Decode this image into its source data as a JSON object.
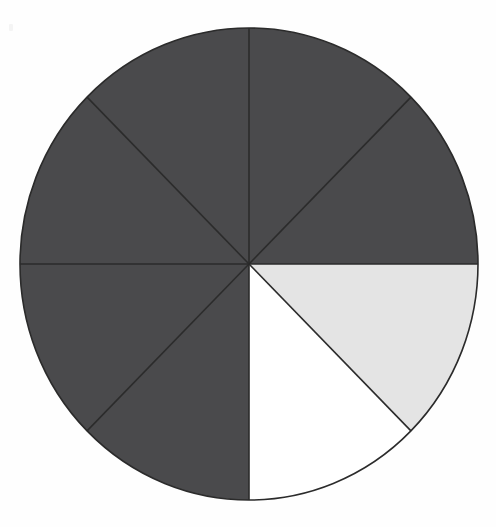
{
  "figure": {
    "title": "Fraction circle divided into eighths",
    "background_color": "#fefefe",
    "stroke_color": "#2b2b2b",
    "stroke_width": 1.6,
    "center_x": 249,
    "center_y": 264,
    "radius_x": 229,
    "radius_y": 236
  },
  "palette": {
    "shaded": "#4a4a4c",
    "light": "#e4e4e4",
    "empty": "#ffffff",
    "outline": "#2b2b2b"
  },
  "chart_data": {
    "type": "pie",
    "title": "Fraction circle divided into eighths",
    "subtitle": "",
    "xlabel": "",
    "ylabel": "",
    "legend_position": "none",
    "grid": false,
    "total_slices": 8,
    "slice_angle_degrees": 45,
    "start_angle_degrees": -90,
    "direction": "clockwise",
    "categories": [
      "slice-1",
      "slice-2",
      "slice-3",
      "slice-4",
      "slice-5",
      "slice-6",
      "slice-7",
      "slice-8"
    ],
    "values": [
      12.5,
      12.5,
      12.5,
      12.5,
      12.5,
      12.5,
      12.5,
      12.5
    ],
    "slices": [
      {
        "name": "slice-1",
        "label": "1/8",
        "value": 12.5,
        "start_deg": -90,
        "end_deg": -45,
        "fill": "#4a4a4c",
        "state": "shaded"
      },
      {
        "name": "slice-2",
        "label": "1/8",
        "value": 12.5,
        "start_deg": -45,
        "end_deg": 0,
        "fill": "#4a4a4c",
        "state": "shaded"
      },
      {
        "name": "slice-3",
        "label": "1/8",
        "value": 12.5,
        "start_deg": 0,
        "end_deg": 45,
        "fill": "#e4e4e4",
        "state": "light"
      },
      {
        "name": "slice-4",
        "label": "1/8",
        "value": 12.5,
        "start_deg": 45,
        "end_deg": 90,
        "fill": "#ffffff",
        "state": "empty"
      },
      {
        "name": "slice-5",
        "label": "1/8",
        "value": 12.5,
        "start_deg": 90,
        "end_deg": 135,
        "fill": "#4a4a4c",
        "state": "shaded"
      },
      {
        "name": "slice-6",
        "label": "1/8",
        "value": 12.5,
        "start_deg": 135,
        "end_deg": 180,
        "fill": "#4a4a4c",
        "state": "shaded"
      },
      {
        "name": "slice-7",
        "label": "1/8",
        "value": 12.5,
        "start_deg": 180,
        "end_deg": 225,
        "fill": "#4a4a4c",
        "state": "shaded"
      },
      {
        "name": "slice-8",
        "label": "1/8",
        "value": 12.5,
        "start_deg": 225,
        "end_deg": 270,
        "fill": "#4a4a4c",
        "state": "shaded"
      }
    ],
    "summary": {
      "shaded_count": 6,
      "light_count": 1,
      "empty_count": 1,
      "shaded_fraction": "6/8",
      "shaded_percent": 75
    }
  }
}
